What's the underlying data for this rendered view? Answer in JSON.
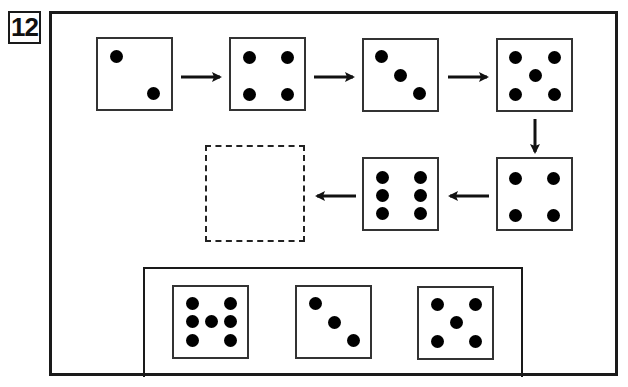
{
  "question": {
    "number": "12"
  },
  "sequence": [
    {
      "index": 1,
      "value": 2,
      "left": 96,
      "top": 37
    },
    {
      "index": 2,
      "value": 4,
      "left": 229,
      "top": 37
    },
    {
      "index": 3,
      "value": 3,
      "left": 362,
      "top": 38
    },
    {
      "index": 4,
      "value": 5,
      "left": 496,
      "top": 38
    },
    {
      "index": 5,
      "value": 4,
      "left": 496,
      "top": 157
    },
    {
      "index": 6,
      "value": 6,
      "left": 362,
      "top": 157
    },
    {
      "index": 7,
      "value": null,
      "blank": true,
      "left": 205,
      "top": 145
    }
  ],
  "arrows": [
    {
      "from": 1,
      "to": 2,
      "direction": "right"
    },
    {
      "from": 2,
      "to": 3,
      "direction": "right"
    },
    {
      "from": 3,
      "to": 4,
      "direction": "right"
    },
    {
      "from": 4,
      "to": 5,
      "direction": "down"
    },
    {
      "from": 5,
      "to": 6,
      "direction": "left"
    },
    {
      "from": 6,
      "to": 7,
      "direction": "left"
    }
  ],
  "choices": [
    {
      "label": "option-1",
      "pattern": "seven-H",
      "pip_count": 7
    },
    {
      "label": "option-2",
      "pattern": "three-diagonal",
      "pip_count": 3
    },
    {
      "label": "option-3",
      "pattern": "five-quincunx",
      "pip_count": 5
    }
  ],
  "colors": {
    "ink": "#000000",
    "border": "#1a1a1a",
    "background": "#ffffff"
  }
}
